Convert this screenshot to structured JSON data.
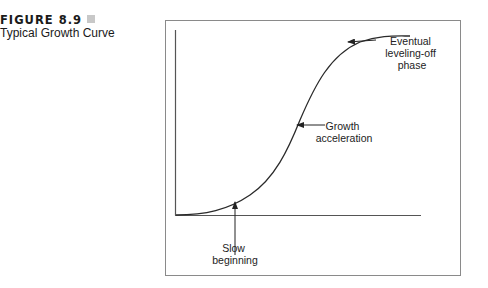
{
  "figure": {
    "number_label": "FIGURE 8.9",
    "title": "Typical Growth Curve"
  },
  "diagram": {
    "type": "s-curve",
    "annotations": {
      "top": [
        "Eventual",
        "leveling-off",
        "phase"
      ],
      "middle": [
        "Growth",
        "acceleration"
      ],
      "bottom": [
        "Slow",
        "beginning"
      ]
    },
    "colors": {
      "line": "#2a2a2a",
      "frame": "#8a8a8a",
      "marker": "#c8c8c8"
    }
  }
}
